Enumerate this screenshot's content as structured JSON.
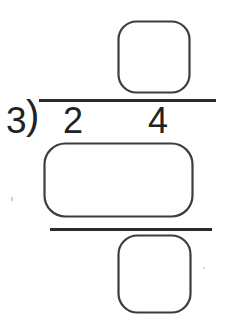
{
  "worksheet": {
    "divisor": "3",
    "bracket_glyph": ")",
    "dividend_digits": [
      "2",
      "4"
    ],
    "answer_boxes": {
      "quotient_value": "",
      "product_value": "",
      "difference_value": ""
    }
  },
  "colors": {
    "background": "#ffffff",
    "line_ink": "#2b2b2b",
    "digit_ink": "#222222",
    "box_stroke": "#3d3d3d",
    "speck": "#b9b9b9"
  }
}
